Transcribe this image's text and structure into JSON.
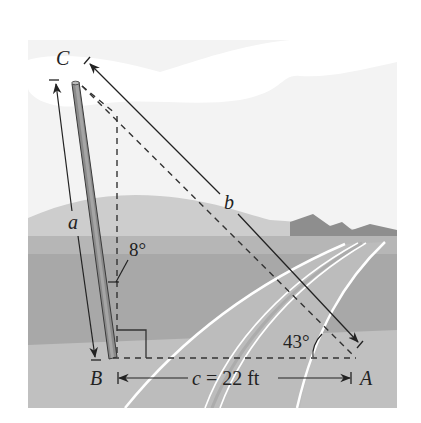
{
  "figure": {
    "type": "right-triangle word problem illustration",
    "scene": "leaning pole beside a road with hills in background"
  },
  "vertices": {
    "A": "A",
    "B": "B",
    "C": "C"
  },
  "sides": {
    "a": "a",
    "b": "b",
    "c_label": "c = 22 ft"
  },
  "angles": {
    "lean": "8°",
    "at_A": "43°"
  },
  "colors": {
    "sky": "#f4f4f4",
    "cloud": "#ffffff",
    "far_hill": "#c9c9c9",
    "mountains": "#8f8f8f",
    "ground": "#a9a9a9",
    "foreground": "#c4c4c4",
    "road": "#bdbdbd",
    "road_edge": "#9a9a9a",
    "pole": "#8a8a8a",
    "line": "#222222"
  }
}
